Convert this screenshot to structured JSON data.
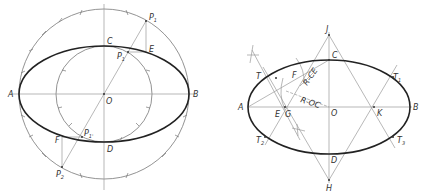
{
  "figure_left": {
    "title": "Concentric circle method",
    "labels": {
      "A": "A",
      "B": "B",
      "C": "C",
      "D": "D",
      "O": "O",
      "P1": "P",
      "P1sub": "1",
      "P1inner": "P",
      "P1innersub": "1",
      "E": "E",
      "F": "F",
      "P2": "P",
      "P2sub": "2",
      "P2inner": "P",
      "P2innersub": "1'"
    }
  },
  "figure_right": {
    "title": "Four-center approximate method",
    "labels": {
      "A": "A",
      "B": "B",
      "C": "C",
      "D": "D",
      "O": "O",
      "J": "J",
      "H": "H",
      "E": "E",
      "G": "G",
      "K": "K",
      "F": "F",
      "T": "T",
      "T1": "T",
      "T1sub": "1",
      "T2": "T",
      "T2sub": "2",
      "T3": "T",
      "T3sub": "3",
      "R_CE": "R-CE",
      "R_OC": "R-OC"
    }
  },
  "colors": {
    "construction": "#9a9a9a",
    "curve": "#222222",
    "text": "#333333"
  }
}
